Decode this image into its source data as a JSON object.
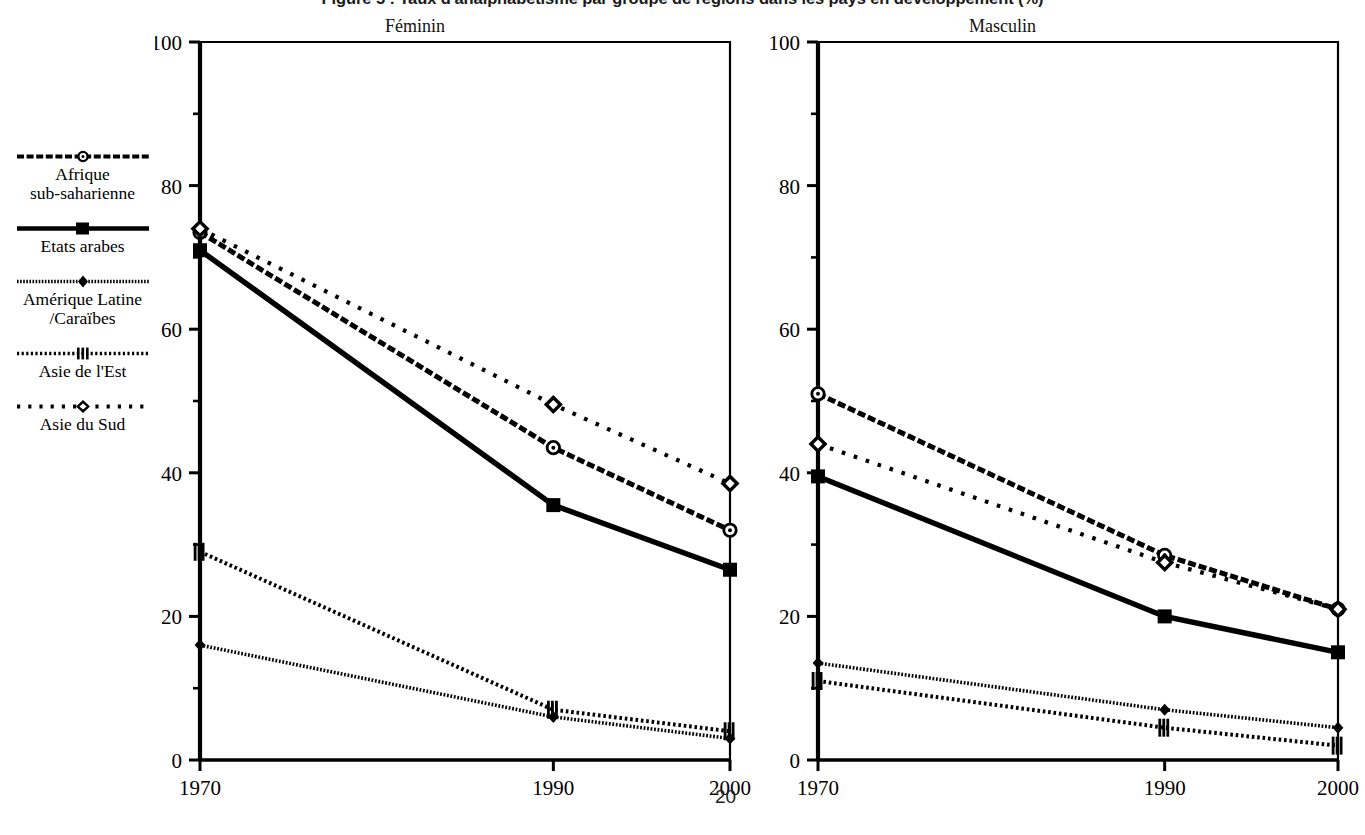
{
  "figure": {
    "title": "Figure 5 : Taux d'analphabétisme par groupe de régions dans les pays en développement (%)",
    "page_number": "20"
  },
  "legend": {
    "items": [
      {
        "label": "Afrique\nsub-saharienne",
        "style": "dash-heavy",
        "marker": "circle-dot",
        "icon": "legend-line-afrique"
      },
      {
        "label": "Etats arabes",
        "style": "solid-thick",
        "marker": "square-filled",
        "icon": "legend-line-etats-arabes"
      },
      {
        "label": "Amérique Latine\n/Caraïbes",
        "style": "fine-dots",
        "marker": "diamond-small",
        "icon": "legend-line-amerique-latine"
      },
      {
        "label": "Asie de l'Est",
        "style": "dotted-small",
        "marker": "bars",
        "icon": "legend-line-asie-est"
      },
      {
        "label": "Asie du Sud",
        "style": "dotted-large",
        "marker": "diamond-open",
        "icon": "legend-line-asie-sud"
      }
    ]
  },
  "panels": [
    {
      "id": "feminin",
      "title": "Féminin"
    },
    {
      "id": "masculin",
      "title": "Masculin"
    }
  ],
  "axes": {
    "y_ticks": [
      "0",
      "20",
      "40",
      "60",
      "80",
      "100"
    ],
    "x_ticks": [
      "1970",
      "1990",
      "2000"
    ]
  },
  "colors": {
    "ink": "#000000",
    "background": "#ffffff"
  },
  "chart_data": {
    "type": "line",
    "title": "Figure 5 : Taux d'analphabétisme par groupe de régions dans les pays en développement (%)",
    "xlabel": "",
    "ylabel": "",
    "x": [
      1970,
      1990,
      2000
    ],
    "xlim": [
      1970,
      2000
    ],
    "ylim": [
      0,
      100
    ],
    "y_ticks": [
      0,
      20,
      40,
      60,
      80,
      100
    ],
    "y_minor_ticks": [
      10,
      30,
      50,
      70,
      90
    ],
    "grid": false,
    "legend_position": "left-outside",
    "panels": [
      {
        "name": "Féminin",
        "series": [
          {
            "name": "Afrique sub-saharienne",
            "values": [
              73.5,
              43.5,
              32.0
            ]
          },
          {
            "name": "Etats arabes",
            "values": [
              71.0,
              35.5,
              26.5
            ]
          },
          {
            "name": "Amérique Latine /Caraïbes",
            "values": [
              16.0,
              6.0,
              3.0
            ]
          },
          {
            "name": "Asie de l'Est",
            "values": [
              29.0,
              7.0,
              4.0
            ]
          },
          {
            "name": "Asie du Sud",
            "values": [
              74.0,
              49.5,
              38.5
            ]
          }
        ]
      },
      {
        "name": "Masculin",
        "series": [
          {
            "name": "Afrique sub-saharienne",
            "values": [
              51.0,
              28.5,
              21.0
            ]
          },
          {
            "name": "Etats arabes",
            "values": [
              39.5,
              20.0,
              15.0
            ]
          },
          {
            "name": "Amérique Latine /Caraïbes",
            "values": [
              13.5,
              7.0,
              4.5
            ]
          },
          {
            "name": "Asie de l'Est",
            "values": [
              11.0,
              4.5,
              2.0
            ]
          },
          {
            "name": "Asie du Sud",
            "values": [
              44.0,
              27.5,
              21.0
            ]
          }
        ]
      }
    ]
  }
}
